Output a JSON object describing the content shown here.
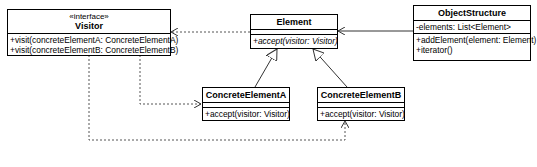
{
  "diagram": {
    "type": "UML class diagram",
    "classes": {
      "visitor": {
        "stereotype": "«interface»",
        "name": "Visitor",
        "attributes": [],
        "operations": [
          "+visit(concreteElementA: ConcreteElementA)",
          "+visit(concreteElementB: ConcreteElementB)"
        ]
      },
      "element": {
        "name": "Element",
        "attributes": [],
        "operations": [
          "+accept(visitor: Visitor)"
        ]
      },
      "object_structure": {
        "name": "ObjectStructure",
        "attributes": [
          "-elements: List<Element>"
        ],
        "operations": [
          "+addElement(element: Element)",
          "+iterator()"
        ]
      },
      "concrete_a": {
        "name": "ConcreteElementA",
        "attributes": [],
        "operations": [
          "+accept(visitor: Visitor)"
        ]
      },
      "concrete_b": {
        "name": "ConcreteElementB",
        "attributes": [],
        "operations": [
          "+accept(visitor: Visitor)"
        ]
      }
    },
    "relationships": [
      {
        "from": "Element",
        "to": "Visitor",
        "kind": "dependency"
      },
      {
        "from": "ObjectStructure",
        "to": "Element",
        "kind": "association"
      },
      {
        "from": "ConcreteElementA",
        "to": "Element",
        "kind": "generalization"
      },
      {
        "from": "ConcreteElementB",
        "to": "Element",
        "kind": "generalization"
      },
      {
        "from": "Visitor",
        "to": "ConcreteElementA",
        "kind": "dependency"
      },
      {
        "from": "Visitor",
        "to": "ConcreteElementB",
        "kind": "dependency"
      }
    ],
    "colors": {
      "line": "#000000",
      "dashed_line": "#555555",
      "background": "#ffffff"
    }
  }
}
